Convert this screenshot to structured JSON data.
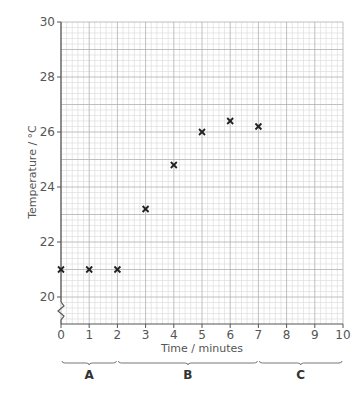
{
  "chart_data": {
    "type": "scatter",
    "title": "",
    "xlabel": "Time / minutes",
    "ylabel": "Temperature / °C",
    "xlim": [
      0,
      10
    ],
    "ylim": [
      19,
      30
    ],
    "x_ticks": [
      "0",
      "1",
      "2",
      "3",
      "4",
      "5",
      "6",
      "7",
      "8",
      "9",
      "10"
    ],
    "y_ticks": [
      "20",
      "22",
      "24",
      "26",
      "28",
      "30"
    ],
    "y_axis_break": true,
    "grid": true,
    "marker": "x",
    "series": [
      {
        "name": "Temperature",
        "x": [
          0,
          1,
          2,
          3,
          4,
          5,
          6,
          7
        ],
        "y": [
          21.0,
          21.0,
          21.0,
          23.2,
          24.8,
          26.0,
          26.4,
          26.2
        ]
      }
    ],
    "regions": [
      {
        "label": "A",
        "x_start": 0,
        "x_end": 2
      },
      {
        "label": "B",
        "x_start": 2,
        "x_end": 7
      },
      {
        "label": "C",
        "x_start": 7,
        "x_end": 10
      }
    ]
  },
  "colors": {
    "grid_minor": "#d9d9d9",
    "grid_major": "#b0b0b0",
    "axis": "#555555",
    "marker": "#222222"
  }
}
